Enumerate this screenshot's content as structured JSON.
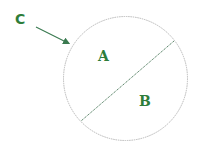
{
  "diagram": {
    "type": "circle-with-chord",
    "labels": {
      "region_a": "A",
      "region_b": "B",
      "circumference": "C"
    },
    "colors": {
      "label": "#2e7d3a",
      "arrow": "#3a7a50",
      "circle_stroke": "#b8b8b8",
      "chord_stroke": "#4c7a5c"
    }
  }
}
